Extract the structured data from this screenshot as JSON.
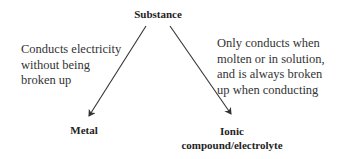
{
  "diagram": {
    "root": {
      "label": "Substance"
    },
    "branches": [
      {
        "description_lines": [
          "Conducts electricity",
          "without being",
          "broken up"
        ],
        "target": {
          "label_lines": [
            "Metal"
          ]
        }
      },
      {
        "description_lines": [
          "Only conducts when",
          "molten or in solution,",
          "and is always broken",
          "up when conducting"
        ],
        "target": {
          "label_lines": [
            "Ionic",
            "compound/electrolyte"
          ]
        }
      }
    ],
    "colors": {
      "text": "#2a2a2a",
      "arrow": "#333333",
      "background": "#ffffff"
    }
  }
}
